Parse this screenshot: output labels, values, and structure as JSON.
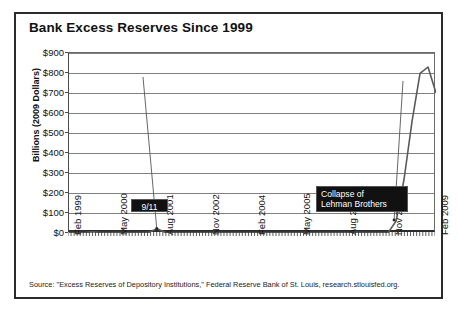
{
  "chart_data": {
    "type": "line",
    "title": "Bank Excess Reserves Since 1999",
    "xlabel": "",
    "ylabel": "Billions (2009 Dollars)",
    "ylim": [
      0,
      900
    ],
    "ytick_labels": [
      "$900",
      "$800",
      "$700",
      "$600",
      "$500",
      "$400",
      "$300",
      "$200",
      "$100",
      "$0"
    ],
    "ytick_values": [
      900,
      800,
      700,
      600,
      500,
      400,
      300,
      200,
      100,
      0
    ],
    "xtick_labels": [
      "Feb 1999",
      "May 2000",
      "Aug 2001",
      "Nov 2002",
      "Feb 2004",
      "May 2005",
      "Aug 2006",
      "Nov 2007",
      "Feb 2009"
    ],
    "grid": "horizontal",
    "legend": "none",
    "series": [
      {
        "name": "Excess Reserves",
        "color": "#5a5a5a",
        "x": [
          "Feb 1999",
          "May 1999",
          "Aug 1999",
          "Nov 1999",
          "Feb 2000",
          "May 2000",
          "Aug 2000",
          "Nov 2000",
          "Feb 2001",
          "May 2001",
          "Aug 2001",
          "Sep 2001",
          "Oct 2001",
          "Nov 2001",
          "Feb 2002",
          "May 2002",
          "Aug 2002",
          "Nov 2002",
          "Feb 2003",
          "May 2003",
          "Aug 2003",
          "Nov 2003",
          "Feb 2004",
          "May 2004",
          "Aug 2004",
          "Nov 2004",
          "Feb 2005",
          "May 2005",
          "Aug 2005",
          "Nov 2005",
          "Feb 2006",
          "May 2006",
          "Aug 2006",
          "Nov 2006",
          "Feb 2007",
          "May 2007",
          "Aug 2007",
          "Nov 2007",
          "Feb 2008",
          "May 2008",
          "Aug 2008",
          "Sep 2008",
          "Oct 2008",
          "Nov 2008",
          "Dec 2008",
          "Jan 2009",
          "Feb 2009"
        ],
        "values": [
          2,
          2,
          2,
          6,
          2,
          2,
          2,
          2,
          2,
          2,
          3,
          22,
          4,
          2,
          2,
          2,
          2,
          2,
          2,
          2,
          2,
          2,
          2,
          2,
          2,
          2,
          2,
          2,
          2,
          2,
          2,
          2,
          2,
          2,
          2,
          2,
          3,
          2,
          2,
          2,
          2,
          60,
          270,
          559,
          798,
          830,
          700
        ]
      }
    ],
    "annotations": [
      {
        "label": "9/11",
        "points_to": "Sep 2001"
      },
      {
        "label": "Collapse of\nLehman Brothers",
        "points_to": "Sep 2008"
      }
    ],
    "source": "Source: \"Excess Reserves of Depository Institutions,\" Federal Reserve Bank of St. Louis, research.stlouisfed.org."
  }
}
